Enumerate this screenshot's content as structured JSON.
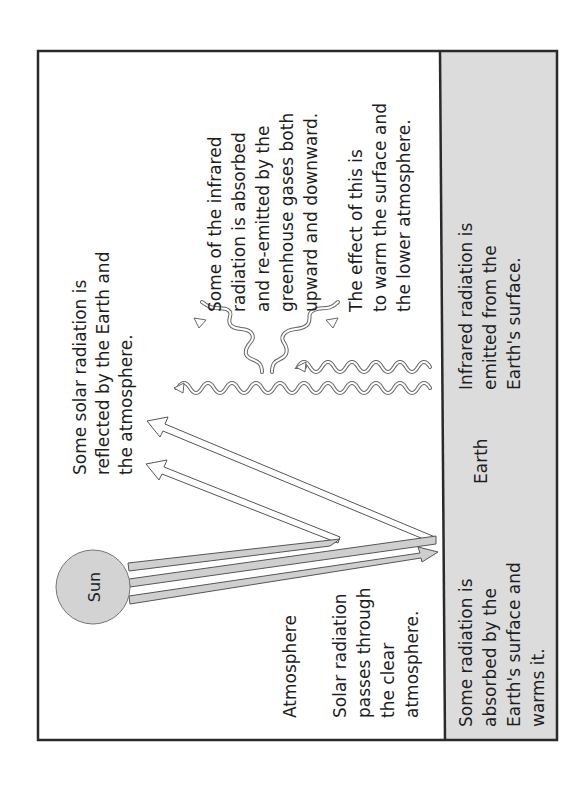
{
  "colors": {
    "frame": "#2a2a2a",
    "earth_fill": "#dcdcdc",
    "sun_fill": "#d3d3d3",
    "beam_fill": "#cfcfcf",
    "outline": "#555555"
  },
  "labels": {
    "sun": "Sun",
    "earth": "Earth",
    "atmosphere": "Atmosphere"
  },
  "captions": {
    "reflected": [
      "Some solar radiation is",
      "reflected by the Earth and",
      "the atmosphere."
    ],
    "greenhouse": [
      "Some of the infrared",
      "radiation is absorbed",
      "and re-emitted by the",
      "greenhouse gases both",
      "upward and downward."
    ],
    "effect": [
      "The effect of this is",
      "to warm the surface and",
      "the lower atmosphere."
    ],
    "passes": [
      "Solar radiation",
      "passes through",
      "the clear",
      "atmosphere."
    ],
    "infrared_emitted": [
      "Infrared radiation is",
      "emitted from the",
      "Earth's surface."
    ],
    "absorbed": [
      "Some radiation is",
      "absorbed by the",
      "Earth's surface and",
      "warms it."
    ]
  }
}
